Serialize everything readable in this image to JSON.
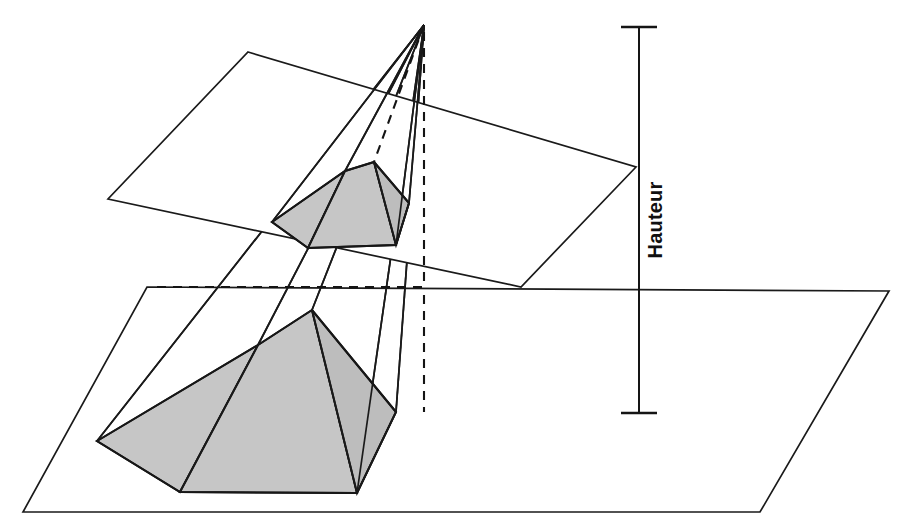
{
  "figure": {
    "background_color": "#ffffff",
    "line_color": "#1a1a1a",
    "shade_color": "#c6c6c6",
    "width": 902,
    "height": 524
  },
  "labels": {
    "height_label": "Hauteur"
  },
  "measurement": {
    "axis_x": 639,
    "top_y": 27,
    "bottom_y": 413,
    "cap_half_width": 18,
    "label": "Hauteur"
  },
  "apex": {
    "x": 424,
    "y": 25
  },
  "lower_plane": {
    "name": "plan-de-base",
    "points": "147,287 889,291 760,512 23,512"
  },
  "upper_plane": {
    "name": "plan-de-section",
    "points": "248,52 636,167 521,287 108,199"
  },
  "lower_pyramid": {
    "name": "grande-pyramide",
    "base_points": "97,441 258,345 312,310 396,412 357,493 180,492",
    "shaded_front": "97,441 258,345 312,310 396,412 357,493 180,492",
    "edges": [
      {
        "name": "edge-apex-to-base-left",
        "d": "M424,25 L97,441"
      },
      {
        "name": "edge-apex-to-base-upper",
        "d": "M424,25 L258,345"
      },
      {
        "name": "edge-apex-to-base-top",
        "d": "M424,25 L312,310"
      },
      {
        "name": "edge-apex-to-base-right",
        "d": "M424,25 L396,412"
      },
      {
        "name": "edge-apex-to-base-br",
        "d": "M424,25 L357,493"
      }
    ]
  },
  "upper_pyramid": {
    "name": "petite-pyramide-section",
    "base_points": "272,222 345,171 374,162 409,203 396,245 308,248",
    "edges": [
      {
        "name": "edge-apex-to-section-left",
        "d": "M424,25 L272,222"
      },
      {
        "name": "edge-apex-to-section-upper",
        "d": "M424,25 L345,171"
      },
      {
        "name": "edge-apex-to-section-top",
        "d": "M424,25 L374,162"
      },
      {
        "name": "edge-apex-to-section-right",
        "d": "M424,25 L409,203"
      },
      {
        "name": "edge-apex-to-section-br",
        "d": "M424,25 L396,245"
      }
    ]
  },
  "dashed_construction": [
    {
      "name": "dashed-vertical-axis",
      "d": "M424,32 L424,287"
    },
    {
      "name": "dashed-vertical-axis-lower",
      "d": "M424,295 L424,412"
    },
    {
      "name": "dashed-hidden-edge-section",
      "d": "M424,25 L374,162"
    },
    {
      "name": "dashed-horizontal-base",
      "d": "M157,287 L424,287"
    }
  ],
  "series_note": {
    "shaded_faces_count": 3,
    "visible_base_edges": 6
  }
}
